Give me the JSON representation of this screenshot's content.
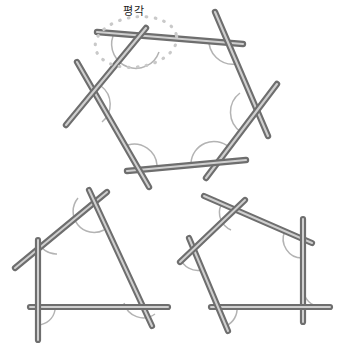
{
  "page": {
    "title": "평각",
    "background_color": "#ffffff",
    "width": 351,
    "height": 362
  },
  "labels": {
    "straight_angle": "평각"
  },
  "colors": {
    "rod_dark_edge": "#6f6f6f",
    "rod_mid": "#8d8d8d",
    "rod_highlight": "#d7d7d7",
    "arc_stroke": "#b0b0b0",
    "dotted_highlight": "#c9c9c9",
    "text": "#1b1b1b",
    "background": "#ffffff"
  },
  "figures": [
    {
      "name": "hexagon",
      "sides": 6,
      "description": "육각형 - 막대로 만든 육각형, 각 꼭짓점에 외각 호 표시",
      "vertices": [
        {
          "x": 137,
          "y": 42
        },
        {
          "x": 231,
          "y": 40
        },
        {
          "x": 259,
          "y": 110
        },
        {
          "x": 214,
          "y": 165
        },
        {
          "x": 140,
          "y": 167
        },
        {
          "x": 84,
          "y": 106
        }
      ],
      "rods": [
        {
          "x1": 97,
          "y1": 32,
          "x2": 243,
          "y2": 44
        },
        {
          "x1": 215,
          "y1": 12,
          "x2": 268,
          "y2": 136
        },
        {
          "x1": 277,
          "y1": 84,
          "x2": 206,
          "y2": 178
        },
        {
          "x1": 246,
          "y1": 160,
          "x2": 127,
          "y2": 171
        },
        {
          "x1": 149,
          "y1": 187,
          "x2": 77,
          "y2": 62
        },
        {
          "x1": 66,
          "y1": 125,
          "x2": 146,
          "y2": 28
        }
      ],
      "angle_arcs": 6
    },
    {
      "name": "quadrilateral",
      "sides": 4,
      "description": "사각형 - 막대로 만든 사각형, 각 꼭짓점에 외각 호 표시",
      "vertices": [
        {
          "x": 96,
          "y": 209
        },
        {
          "x": 141,
          "y": 307
        },
        {
          "x": 38,
          "y": 307
        },
        {
          "x": 38,
          "y": 260
        }
      ],
      "rods": [
        {
          "x1": 15,
          "y1": 268,
          "x2": 107,
          "y2": 192
        },
        {
          "x1": 89,
          "y1": 190,
          "x2": 152,
          "y2": 326
        },
        {
          "x1": 168,
          "y1": 307,
          "x2": 30,
          "y2": 307
        },
        {
          "x1": 38,
          "y1": 240,
          "x2": 38,
          "y2": 340
        }
      ],
      "angle_arcs": 4
    },
    {
      "name": "pentagon",
      "sides": 5,
      "description": "오각형 - 막대로 만든 오각형, 각 꼭짓점에 외각 호 표시",
      "vertices": [
        {
          "x": 236,
          "y": 211
        },
        {
          "x": 303,
          "y": 239
        },
        {
          "x": 301,
          "y": 307
        },
        {
          "x": 219,
          "y": 307
        },
        {
          "x": 196,
          "y": 252
        }
      ],
      "rods": [
        {
          "x1": 204,
          "y1": 196,
          "x2": 312,
          "y2": 243
        },
        {
          "x1": 303,
          "y1": 219,
          "x2": 303,
          "y2": 322
        },
        {
          "x1": 330,
          "y1": 307,
          "x2": 211,
          "y2": 307
        },
        {
          "x1": 228,
          "y1": 331,
          "x2": 189,
          "y2": 238
        },
        {
          "x1": 180,
          "y1": 262,
          "x2": 245,
          "y2": 200
        }
      ],
      "angle_arcs": 5
    }
  ],
  "highlight": {
    "name": "straight-angle-highlight",
    "shape": "dotted-ellipse",
    "center": {
      "x": 136,
      "y": 42
    },
    "radius_x": 41,
    "radius_y": 25,
    "rotation_deg": -8,
    "dot_count": 26
  }
}
